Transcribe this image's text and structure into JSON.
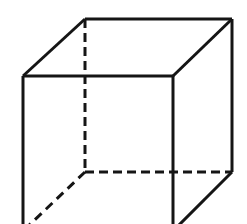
{
  "figure": {
    "shape": "cube",
    "projection": "oblique",
    "cropped_at_bottom": true
  },
  "canvas": {
    "width": 247,
    "height": 224,
    "background_color": "#ffffff"
  },
  "style": {
    "line_color": "#151515",
    "visible_stroke_width": 3,
    "hidden_stroke_width": 3,
    "hidden_dash_pattern": "9 5",
    "hidden_dash_pattern_diagonal": "9 6"
  },
  "vertices": {
    "back_top_left": {
      "label": "back-top-left",
      "x": 85,
      "y": 19
    },
    "back_top_right": {
      "label": "back-top-right",
      "x": 232,
      "y": 19
    },
    "back_bottom_left": {
      "label": "back-bottom-left",
      "x": 85,
      "y": 172
    },
    "back_bottom_right": {
      "label": "back-bottom-right",
      "x": 232,
      "y": 172
    },
    "front_top_left": {
      "label": "front-top-left",
      "x": 23,
      "y": 76
    },
    "front_top_right": {
      "label": "front-top-right",
      "x": 173,
      "y": 76
    },
    "front_bottom_left": {
      "label": "front-bottom-left",
      "x": 23,
      "y": 231
    },
    "front_bottom_right": {
      "label": "front-bottom-right",
      "x": 173,
      "y": 231
    }
  },
  "edges": {
    "visible": [
      {
        "name": "back-top-edge",
        "d": "M 85 19 L 232 19"
      },
      {
        "name": "back-right-vertical-edge",
        "d": "M 232 19 L 232 172"
      },
      {
        "name": "front-top-edge",
        "d": "M 23 76 L 173 76"
      },
      {
        "name": "front-left-vertical-edge",
        "d": "M 23 76 L 23 231"
      },
      {
        "name": "front-right-vertical-edge",
        "d": "M 173 76 L 173 231"
      },
      {
        "name": "top-left-diagonal-edge",
        "d": "M 23 76 L 85 19"
      },
      {
        "name": "top-right-diagonal-edge",
        "d": "M 173 76 L 232 19"
      },
      {
        "name": "bottom-right-diagonal-edge",
        "d": "M 173 231 L 232 172"
      }
    ],
    "hidden": [
      {
        "name": "back-left-vertical-edge",
        "d": "M 85 19 L 85 172",
        "dash": "9 5"
      },
      {
        "name": "back-bottom-edge",
        "d": "M 85 172 L 232 172",
        "dash": "9 5"
      },
      {
        "name": "bottom-left-diagonal-edge",
        "d": "M 85 172 L 23 231",
        "dash": "9 6"
      }
    ]
  }
}
